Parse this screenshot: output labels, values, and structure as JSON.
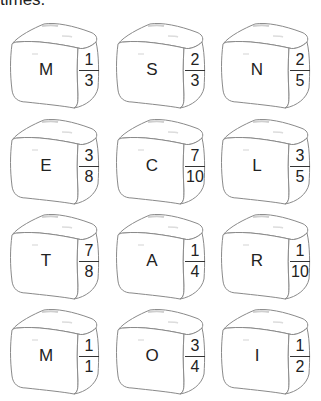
{
  "header": {
    "partial_text": "times."
  },
  "cubes": [
    {
      "letter": "M",
      "num": "1",
      "den": "3"
    },
    {
      "letter": "S",
      "num": "2",
      "den": "3"
    },
    {
      "letter": "N",
      "num": "2",
      "den": "5"
    },
    {
      "letter": "E",
      "num": "3",
      "den": "8"
    },
    {
      "letter": "C",
      "num": "7",
      "den": "10"
    },
    {
      "letter": "L",
      "num": "3",
      "den": "5"
    },
    {
      "letter": "T",
      "num": "7",
      "den": "8"
    },
    {
      "letter": "A",
      "num": "1",
      "den": "4"
    },
    {
      "letter": "R",
      "num": "1",
      "den": "10"
    },
    {
      "letter": "M",
      "num": "1",
      "den": "1"
    },
    {
      "letter": "O",
      "num": "3",
      "den": "4"
    },
    {
      "letter": "I",
      "num": "1",
      "den": "2"
    }
  ],
  "colors": {
    "outline": "#8a8a8a",
    "text": "#222222",
    "background": "#ffffff"
  }
}
